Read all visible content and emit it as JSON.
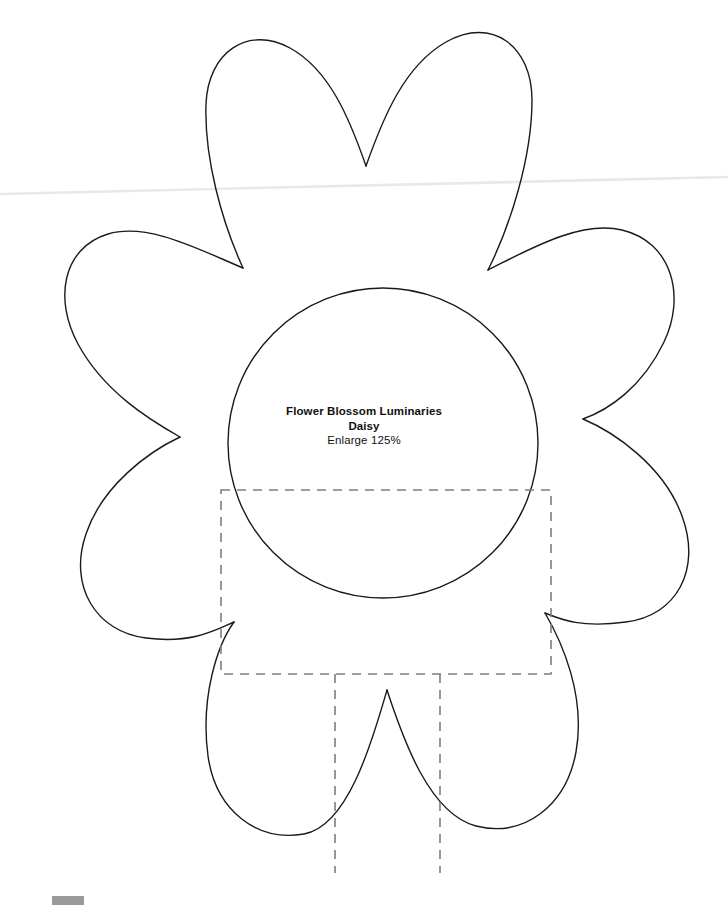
{
  "document": {
    "kind": "craft-template-scan",
    "background_color": "#ffffff",
    "page_width": 728,
    "page_height": 906
  },
  "label": {
    "title": "Flower Blossom Luminaries",
    "subtitle": "Daisy",
    "instruction": "Enlarge 125%",
    "text_color": "#111111"
  },
  "artwork": {
    "outline_color": "#1a1a1a",
    "outline_width": 1.4,
    "fold_line_color": "#7d7d7d",
    "fold_line_width": 1.6,
    "fold_dash": "9 7",
    "scan_line_color": "#e8e8e8",
    "petal_count": 6,
    "center_circle": {
      "cx": 383,
      "cy": 443,
      "r": 155
    },
    "fold_rectangle": {
      "left": 221,
      "top": 490,
      "right": 551,
      "bottom": 674
    },
    "fold_verticals": [
      {
        "x": 335,
        "from": 674,
        "to": 873
      },
      {
        "x": 440,
        "from": 674,
        "to": 873
      }
    ],
    "scan_line": {
      "x1": 0,
      "y1": 194,
      "x2": 728,
      "y2": 177
    }
  },
  "corner_mark": {
    "color": "#9a9a9a",
    "x": 52,
    "y": 896,
    "width": 32,
    "height": 9
  }
}
